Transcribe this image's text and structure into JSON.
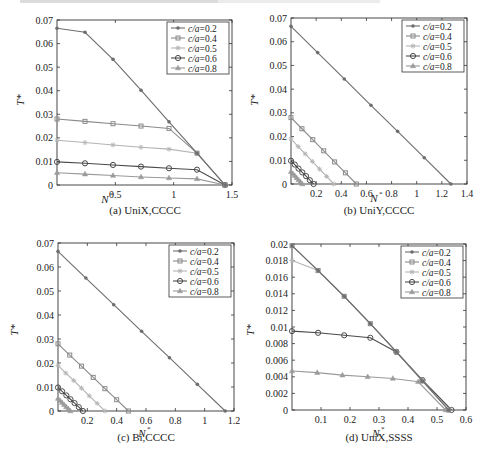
{
  "chart_data": [
    {
      "type": "line",
      "title": "(a) UniX,CCCC",
      "xlabel": "N*",
      "ylabel": "T*",
      "xlim": [
        0,
        1.5
      ],
      "ylim": [
        0,
        0.07
      ],
      "xticks": [
        "0.5",
        "1",
        "1.5"
      ],
      "yticks": [
        "0",
        "0.01",
        "0.02",
        "0.03",
        "0.04",
        "0.05",
        "0.06",
        "0.07"
      ],
      "legend_position": "upper right",
      "grid": false,
      "series": [
        {
          "name": "c/a=0.2",
          "marker": "dot",
          "color": "#6e6e6e",
          "x": [
            0,
            0.24,
            0.48,
            0.72,
            0.96,
            1.2,
            1.44
          ],
          "y": [
            0.0665,
            0.0648,
            0.0533,
            0.0402,
            0.0268,
            0.0135,
            0
          ]
        },
        {
          "name": "c/a=0.4",
          "marker": "square",
          "color": "#8a8a8a",
          "x": [
            0,
            0.24,
            0.48,
            0.72,
            0.96,
            1.2,
            1.44
          ],
          "y": [
            0.028,
            0.027,
            0.026,
            0.025,
            0.024,
            0.0135,
            0
          ]
        },
        {
          "name": "c/a=0.5",
          "marker": "star",
          "color": "#b4b4b4",
          "x": [
            0,
            0.24,
            0.48,
            0.72,
            0.96,
            1.2,
            1.44
          ],
          "y": [
            0.019,
            0.018,
            0.017,
            0.016,
            0.0152,
            0.0135,
            0
          ]
        },
        {
          "name": "c/a=0.6",
          "marker": "circle",
          "color": "#4a4a4a",
          "x": [
            0,
            0.24,
            0.48,
            0.72,
            0.96,
            1.2,
            1.44
          ],
          "y": [
            0.0098,
            0.0092,
            0.0085,
            0.0078,
            0.0071,
            0.0065,
            0
          ]
        },
        {
          "name": "c/a=0.8",
          "marker": "triangle",
          "color": "#9a9a9a",
          "x": [
            0,
            0.24,
            0.48,
            0.72,
            0.96,
            1.2,
            1.44
          ],
          "y": [
            0.0052,
            0.0046,
            0.004,
            0.0034,
            0.003,
            0.0026,
            0
          ]
        }
      ]
    },
    {
      "type": "line",
      "title": "(b) UniY,CCCC",
      "xlabel": "N*",
      "ylabel": "T*",
      "xlim": [
        0,
        1.4
      ],
      "ylim": [
        0,
        0.07
      ],
      "xticks": [
        "0.2",
        "0.4",
        "0.6",
        "0.8",
        "1",
        "1.2",
        "1.4"
      ],
      "yticks": [
        "0",
        "0.01",
        "0.02",
        "0.03",
        "0.04",
        "0.05",
        "0.06",
        "0.07"
      ],
      "legend_position": "upper right",
      "grid": false,
      "series": [
        {
          "name": "c/a=0.2",
          "marker": "dot",
          "color": "#6e6e6e",
          "x": [
            0,
            0.212,
            0.424,
            0.636,
            0.848,
            1.06,
            1.272
          ],
          "y": [
            0.0665,
            0.0554,
            0.0443,
            0.0332,
            0.0222,
            0.0111,
            0
          ]
        },
        {
          "name": "c/a=0.4",
          "marker": "square",
          "color": "#8a8a8a",
          "x": [
            0,
            0.087,
            0.173,
            0.26,
            0.347,
            0.433,
            0.52
          ],
          "y": [
            0.028,
            0.0233,
            0.0187,
            0.014,
            0.0093,
            0.0047,
            0
          ]
        },
        {
          "name": "c/a=0.5",
          "marker": "star",
          "color": "#b4b4b4",
          "x": [
            0,
            0.057,
            0.113,
            0.17,
            0.227,
            0.283,
            0.34
          ],
          "y": [
            0.019,
            0.0158,
            0.0127,
            0.0095,
            0.0063,
            0.0032,
            0
          ]
        },
        {
          "name": "c/a=0.6",
          "marker": "circle",
          "color": "#4a4a4a",
          "x": [
            0,
            0.03,
            0.06,
            0.09,
            0.12,
            0.15,
            0.18
          ],
          "y": [
            0.0098,
            0.0082,
            0.0065,
            0.0049,
            0.0033,
            0.0016,
            0
          ]
        },
        {
          "name": "c/a=0.8",
          "marker": "triangle",
          "color": "#9a9a9a",
          "x": [
            0,
            0.015,
            0.03,
            0.045,
            0.06,
            0.075,
            0.09
          ],
          "y": [
            0.0052,
            0.0043,
            0.0035,
            0.0026,
            0.0017,
            0.0009,
            0
          ]
        }
      ]
    },
    {
      "type": "line",
      "title": "(c) Bi,CCCC",
      "xlabel": "N*",
      "ylabel": "T*",
      "xlim": [
        0,
        1.2
      ],
      "ylim": [
        0,
        0.07
      ],
      "xticks": [
        "0.2",
        "0.4",
        "0.6",
        "0.8",
        "1",
        "1.2"
      ],
      "yticks": [
        "0",
        "0.01",
        "0.02",
        "0.03",
        "0.04",
        "0.05",
        "0.06",
        "0.07"
      ],
      "legend_position": "upper right",
      "grid": false,
      "series": [
        {
          "name": "c/a=0.2",
          "marker": "dot",
          "color": "#6e6e6e",
          "x": [
            0,
            0.19,
            0.38,
            0.57,
            0.76,
            0.95,
            1.14
          ],
          "y": [
            0.0665,
            0.0554,
            0.0443,
            0.0332,
            0.0222,
            0.0111,
            0
          ]
        },
        {
          "name": "c/a=0.4",
          "marker": "square",
          "color": "#8a8a8a",
          "x": [
            0,
            0.08,
            0.16,
            0.24,
            0.32,
            0.4,
            0.48
          ],
          "y": [
            0.028,
            0.0233,
            0.0187,
            0.014,
            0.0093,
            0.0047,
            0
          ]
        },
        {
          "name": "c/a=0.5",
          "marker": "star",
          "color": "#b4b4b4",
          "x": [
            0,
            0.053,
            0.107,
            0.16,
            0.213,
            0.267,
            0.32
          ],
          "y": [
            0.019,
            0.0158,
            0.0127,
            0.0095,
            0.0063,
            0.0032,
            0
          ]
        },
        {
          "name": "c/a=0.6",
          "marker": "circle",
          "color": "#4a4a4a",
          "x": [
            0,
            0.028,
            0.057,
            0.085,
            0.113,
            0.142,
            0.17
          ],
          "y": [
            0.0098,
            0.0082,
            0.0065,
            0.0049,
            0.0033,
            0.0016,
            0
          ]
        },
        {
          "name": "c/a=0.8",
          "marker": "triangle",
          "color": "#9a9a9a",
          "x": [
            0,
            0.014,
            0.028,
            0.042,
            0.056,
            0.07,
            0.084
          ],
          "y": [
            0.0052,
            0.0043,
            0.0035,
            0.0026,
            0.0017,
            0.0009,
            0
          ]
        }
      ]
    },
    {
      "type": "line",
      "title": "(d) UniX,SSSS",
      "xlabel": "N*",
      "ylabel": "T*",
      "xlim": [
        0,
        0.6
      ],
      "ylim": [
        0,
        0.02
      ],
      "xticks": [
        "0.1",
        "0.2",
        "0.3",
        "0.4",
        "0.5",
        "0.6"
      ],
      "yticks": [
        "0",
        "0.002",
        "0.004",
        "0.006",
        "0.008",
        "0.01",
        "0.012",
        "0.014",
        "0.016",
        "0.018",
        "0.02"
      ],
      "legend_position": "upper right",
      "grid": false,
      "series": [
        {
          "name": "c/a=0.2",
          "marker": "dot",
          "color": "#6e6e6e",
          "x": [
            0,
            0.09,
            0.18,
            0.27,
            0.36,
            0.45,
            0.54
          ],
          "y": [
            0.0198,
            0.0168,
            0.0137,
            0.0104,
            0.007,
            0.0035,
            0
          ]
        },
        {
          "name": "c/a=0.4",
          "marker": "square",
          "color": "#8a8a8a",
          "x": [
            0,
            0.09,
            0.18,
            0.27,
            0.36,
            0.45,
            0.54
          ],
          "y": [
            0.0198,
            0.0168,
            0.0137,
            0.0104,
            0.007,
            0.0035,
            0
          ]
        },
        {
          "name": "c/a=0.5",
          "marker": "star",
          "color": "#b4b4b4",
          "x": [
            0,
            0.09,
            0.18,
            0.27,
            0.36,
            0.45,
            0.54
          ],
          "y": [
            0.018,
            0.0168,
            0.0137,
            0.0104,
            0.007,
            0.0035,
            0
          ]
        },
        {
          "name": "c/a=0.6",
          "marker": "circle",
          "color": "#4a4a4a",
          "x": [
            0,
            0.09,
            0.18,
            0.27,
            0.36,
            0.45,
            0.55
          ],
          "y": [
            0.0095,
            0.0093,
            0.009,
            0.0087,
            0.007,
            0.0036,
            0
          ]
        },
        {
          "name": "c/a=0.8",
          "marker": "triangle",
          "color": "#9a9a9a",
          "x": [
            0,
            0.087,
            0.174,
            0.261,
            0.348,
            0.435,
            0.53
          ],
          "y": [
            0.0047,
            0.0045,
            0.0042,
            0.004,
            0.0038,
            0.0034,
            0
          ]
        }
      ]
    }
  ],
  "panels": [
    {
      "caption": "(a) UniX,CCCC",
      "xlabel": "N",
      "ylabel": "T"
    },
    {
      "caption": "(b) UniY,CCCC",
      "xlabel": "N",
      "ylabel": "T"
    },
    {
      "caption": "(c) Bi,CCCC",
      "xlabel": "N",
      "ylabel": "T"
    },
    {
      "caption": "(d) UniX,SSSS",
      "xlabel": "N",
      "ylabel": "T"
    }
  ]
}
